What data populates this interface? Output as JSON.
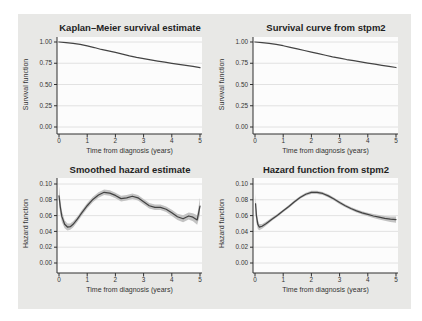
{
  "style": {
    "figure_bg": "#e8e8e6",
    "plot_bg": "#fcfcfc",
    "grid_color": "#dfdfdf",
    "axis_color": "#2f2f2f",
    "line_color": "#434343",
    "band_color": "#c3c3c3",
    "text_color": "#333333"
  },
  "chart_data": [
    {
      "type": "line",
      "title": "Kaplan–Meier survival estimate",
      "xlabel": "Time from diagnosis (years)",
      "ylabel": "Survival function",
      "xlim": [
        0,
        5
      ],
      "ylim": [
        0,
        1
      ],
      "xticks": [
        0,
        1,
        2,
        3,
        4,
        5
      ],
      "xtick_labels": [
        "0",
        "1",
        "2",
        "3",
        "4",
        "5"
      ],
      "yticks": [
        0,
        0.25,
        0.5,
        0.75,
        1
      ],
      "ytick_labels": [
        "0.00",
        "0.25",
        "0.50",
        "0.75",
        "1.00"
      ],
      "grid": "horizontal",
      "legend": "none",
      "series": [
        {
          "name": "Kaplan–Meier survival estimate",
          "x": [
            0,
            0.25,
            0.5,
            0.75,
            1,
            1.25,
            1.5,
            1.75,
            2,
            2.25,
            2.5,
            2.75,
            3,
            3.25,
            3.5,
            3.75,
            4,
            4.25,
            4.5,
            4.75,
            5
          ],
          "y": [
            1.0,
            0.994,
            0.985,
            0.972,
            0.955,
            0.935,
            0.912,
            0.895,
            0.878,
            0.858,
            0.838,
            0.82,
            0.805,
            0.79,
            0.776,
            0.762,
            0.749,
            0.737,
            0.725,
            0.712,
            0.698
          ]
        }
      ]
    },
    {
      "type": "line",
      "title": "Survival curve from stpm2",
      "xlabel": "Time from diagnosis (years)",
      "ylabel": "Survival function",
      "xlim": [
        0,
        5
      ],
      "ylim": [
        0,
        1
      ],
      "xticks": [
        0,
        1,
        2,
        3,
        4,
        5
      ],
      "xtick_labels": [
        "0",
        "1",
        "2",
        "3",
        "4",
        "5"
      ],
      "yticks": [
        0,
        0.25,
        0.5,
        0.75,
        1
      ],
      "ytick_labels": [
        "0.00",
        "0.25",
        "0.50",
        "0.75",
        "1.00"
      ],
      "grid": "horizontal",
      "legend": "none",
      "series": [
        {
          "name": "Predicted survival (stpm2)",
          "x": [
            0,
            0.25,
            0.5,
            0.75,
            1,
            1.25,
            1.5,
            1.75,
            2,
            2.25,
            2.5,
            2.75,
            3,
            3.25,
            3.5,
            3.75,
            4,
            4.25,
            4.5,
            4.75,
            5
          ],
          "y": [
            1.0,
            0.993,
            0.984,
            0.971,
            0.956,
            0.938,
            0.919,
            0.9,
            0.881,
            0.862,
            0.844,
            0.826,
            0.81,
            0.794,
            0.78,
            0.766,
            0.752,
            0.739,
            0.726,
            0.713,
            0.7
          ]
        }
      ]
    },
    {
      "type": "line",
      "title": "Smoothed hazard estimate",
      "xlabel": "Time from diagnosis (years)",
      "ylabel": "Hazard function",
      "xlim": [
        0,
        5
      ],
      "ylim": [
        0,
        0.1
      ],
      "xticks": [
        0,
        1,
        2,
        3,
        4,
        5
      ],
      "xtick_labels": [
        "0",
        "1",
        "2",
        "3",
        "4",
        "5"
      ],
      "yticks": [
        0,
        0.02,
        0.04,
        0.06,
        0.08,
        0.1
      ],
      "ytick_labels": [
        "0.00",
        "0.02",
        "0.04",
        "0.06",
        "0.08",
        "0.10"
      ],
      "grid": "horizontal",
      "legend": "none",
      "series": [
        {
          "name": "Smoothed hazard with 95% CI band",
          "x": [
            0,
            0.05,
            0.1,
            0.2,
            0.3,
            0.4,
            0.5,
            0.65,
            0.8,
            1.0,
            1.2,
            1.4,
            1.6,
            1.8,
            2.0,
            2.2,
            2.4,
            2.6,
            2.8,
            3.0,
            3.2,
            3.4,
            3.6,
            3.8,
            4.0,
            4.2,
            4.4,
            4.6,
            4.75,
            4.9,
            5.0
          ],
          "y": [
            0.085,
            0.07,
            0.059,
            0.049,
            0.0455,
            0.046,
            0.049,
            0.0555,
            0.063,
            0.0725,
            0.0805,
            0.086,
            0.0895,
            0.0885,
            0.0855,
            0.0815,
            0.0825,
            0.0845,
            0.0825,
            0.0775,
            0.0725,
            0.0705,
            0.0705,
            0.068,
            0.0635,
            0.0585,
            0.056,
            0.0595,
            0.058,
            0.0545,
            0.072
          ],
          "ci_halfwidth": [
            0.012,
            0.009,
            0.007,
            0.005,
            0.0045,
            0.004,
            0.004,
            0.0035,
            0.0035,
            0.0035,
            0.0035,
            0.0035,
            0.0035,
            0.0035,
            0.0035,
            0.0035,
            0.0035,
            0.0035,
            0.0035,
            0.0035,
            0.0035,
            0.0035,
            0.0035,
            0.0035,
            0.004,
            0.004,
            0.0045,
            0.0045,
            0.005,
            0.006,
            0.011
          ]
        }
      ]
    },
    {
      "type": "line",
      "title": "Hazard function from stpm2",
      "xlabel": "Time from diagnosis (years)",
      "ylabel": "Hazard function",
      "xlim": [
        0,
        5
      ],
      "ylim": [
        0,
        0.1
      ],
      "xticks": [
        0,
        1,
        2,
        3,
        4,
        5
      ],
      "xtick_labels": [
        "0",
        "1",
        "2",
        "3",
        "4",
        "5"
      ],
      "yticks": [
        0,
        0.02,
        0.04,
        0.06,
        0.08,
        0.1
      ],
      "ytick_labels": [
        "0.00",
        "0.02",
        "0.04",
        "0.06",
        "0.08",
        "0.10"
      ],
      "grid": "horizontal",
      "legend": "none",
      "series": [
        {
          "name": "Predicted hazard (stpm2) with 95% CI band",
          "x": [
            0.02,
            0.05,
            0.1,
            0.15,
            0.25,
            0.4,
            0.6,
            0.8,
            1.0,
            1.2,
            1.4,
            1.6,
            1.8,
            2.0,
            2.2,
            2.4,
            2.6,
            2.8,
            3.0,
            3.2,
            3.4,
            3.6,
            3.8,
            4.0,
            4.2,
            4.4,
            4.6,
            4.8,
            5.0
          ],
          "y": [
            0.075,
            0.06,
            0.049,
            0.0455,
            0.0465,
            0.05,
            0.0555,
            0.0605,
            0.066,
            0.0715,
            0.0775,
            0.083,
            0.087,
            0.0893,
            0.0895,
            0.088,
            0.085,
            0.081,
            0.0765,
            0.0725,
            0.069,
            0.066,
            0.0635,
            0.0615,
            0.0595,
            0.058,
            0.0565,
            0.0555,
            0.055
          ],
          "ci_halfwidth": [
            0.013,
            0.009,
            0.006,
            0.004,
            0.003,
            0.0025,
            0.002,
            0.002,
            0.0018,
            0.0018,
            0.0018,
            0.0018,
            0.002,
            0.002,
            0.002,
            0.002,
            0.002,
            0.002,
            0.002,
            0.002,
            0.002,
            0.002,
            0.002,
            0.0022,
            0.0025,
            0.0028,
            0.003,
            0.0035,
            0.004
          ]
        }
      ]
    }
  ]
}
